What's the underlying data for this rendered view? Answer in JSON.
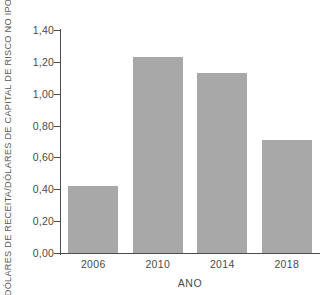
{
  "chart_data": {
    "type": "bar",
    "title": "",
    "categories": [
      "2006",
      "2010",
      "2014",
      "2018"
    ],
    "values": [
      0.42,
      1.23,
      1.13,
      0.71
    ],
    "xlabel": "ANO",
    "ylabel": "DÓLARES DE RECEITA/DÓLARES DE CAPITAL DE RISCO NO IPO",
    "ylim": [
      0.0,
      1.4
    ],
    "ytick_labels": [
      "0,00",
      "0,20",
      "0,40",
      "0,60",
      "0,80",
      "1,00",
      "1,20",
      "1,40"
    ],
    "ytick_values": [
      0.0,
      0.2,
      0.4,
      0.6,
      0.8,
      1.0,
      1.2,
      1.4
    ],
    "grid": false,
    "legend": false,
    "decimal_separator": ",",
    "colors": {
      "bar_fill": "#a8a8a8",
      "axis_line": "#4d4d4d",
      "text": "#4a4a4a",
      "background": "#ffffff"
    }
  }
}
